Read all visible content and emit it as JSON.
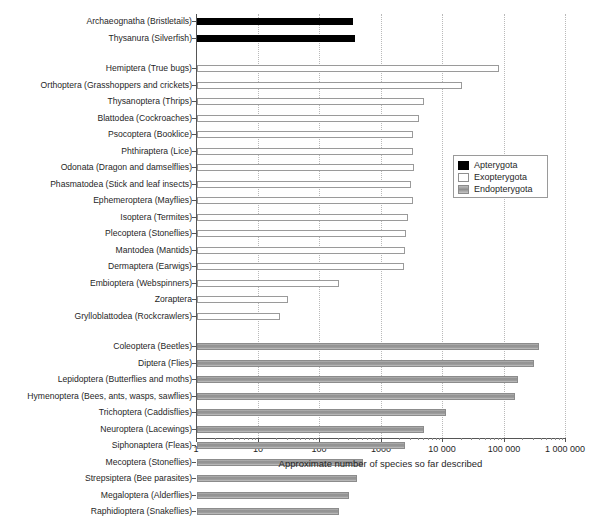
{
  "header": {
    "ghost_text": ""
  },
  "legend": {
    "position": "middle-right",
    "items": [
      {
        "label": "Apterygota",
        "swatch": "apterygota",
        "color": "#000000"
      },
      {
        "label": "Exopterygota",
        "swatch": "exopterygota",
        "color": "#ffffff"
      },
      {
        "label": "Endopterygota",
        "swatch": "endopterygota",
        "color": "#999999"
      }
    ]
  },
  "chart_data": {
    "type": "bar",
    "orientation": "horizontal",
    "title": "",
    "xlabel": "Approximate number of species so far described",
    "ylabel": "",
    "xscale": "log",
    "xlim": [
      1,
      1000000
    ],
    "grid": true,
    "xticks": [
      1,
      10,
      100,
      1000,
      10000,
      100000,
      1000000
    ],
    "xtick_labels": [
      "1",
      "10",
      "100",
      "1000",
      "10 000",
      "100 000",
      "1 000 000"
    ],
    "groups": [
      {
        "name": "Apterygota",
        "color": "#000000",
        "rows": [
          {
            "label": "Archaeognatha (Bristletails)",
            "value": 350
          },
          {
            "label": "Thysanura (Silverfish)",
            "value": 370
          }
        ]
      },
      {
        "name": "Exopterygota",
        "color": "#ffffff",
        "rows": [
          {
            "label": "Hemiptera (True bugs)",
            "value": 82000
          },
          {
            "label": "Orthoptera (Grasshoppers and crickets)",
            "value": 20000
          },
          {
            "label": "Thysanoptera (Thrips)",
            "value": 5000
          },
          {
            "label": "Blattodea (Cockroaches)",
            "value": 4000
          },
          {
            "label": "Psocoptera (Booklice)",
            "value": 3200
          },
          {
            "label": "Phthiraptera (Lice)",
            "value": 3200
          },
          {
            "label": "Odonata (Dragon and damselflies)",
            "value": 3400
          },
          {
            "label": "Phasmatodea (Stick and leaf insects)",
            "value": 3000
          },
          {
            "label": "Ephemeroptera (Mayflies)",
            "value": 3200
          },
          {
            "label": "Isoptera (Termites)",
            "value": 2700
          },
          {
            "label": "Plecoptera (Stoneflies)",
            "value": 2500
          },
          {
            "label": "Mantodea (Mantids)",
            "value": 2400
          },
          {
            "label": "Dermaptera (Earwigs)",
            "value": 2300
          },
          {
            "label": "Embioptera (Webspinners)",
            "value": 200
          },
          {
            "label": "Zoraptera",
            "value": 30
          },
          {
            "label": "Grylloblattodea (Rockcrawlers)",
            "value": 22
          }
        ]
      },
      {
        "name": "Endopterygota",
        "color": "#999999",
        "rows": [
          {
            "label": "Coleoptera (Beetles)",
            "value": 370000
          },
          {
            "label": "Diptera (Flies)",
            "value": 300000
          },
          {
            "label": "Lepidoptera (Butterflies and moths)",
            "value": 165000
          },
          {
            "label": "Hymenoptera (Bees, ants, wasps, sawflies)",
            "value": 150000
          },
          {
            "label": "Trichoptera (Caddisflies)",
            "value": 11000
          },
          {
            "label": "Neuroptera (Lacewings)",
            "value": 5000
          },
          {
            "label": "Siphonaptera (Fleas)",
            "value": 2400
          },
          {
            "label": "Mecoptera (Stoneflies)",
            "value": 500
          },
          {
            "label": "Strepsiptera (Bee parasites)",
            "value": 400
          },
          {
            "label": "Megaloptera (Alderflies)",
            "value": 300
          },
          {
            "label": "Raphidioptera (Snakeflies)",
            "value": 200
          }
        ]
      }
    ]
  }
}
